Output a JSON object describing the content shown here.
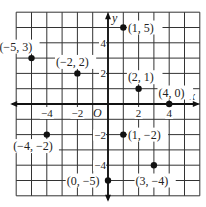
{
  "diagram": {
    "type": "coordinate-plane",
    "grid": {
      "xmin": -6,
      "xmax": 6,
      "ymin": -6,
      "ymax": 6
    },
    "axes": {
      "x_label": "x",
      "y_label": "y",
      "origin_label": "O"
    },
    "x_ticks": [
      {
        "value": -4,
        "label": "−4"
      },
      {
        "value": -2,
        "label": "−2"
      },
      {
        "value": 2,
        "label": "2"
      },
      {
        "value": 4,
        "label": "4"
      }
    ],
    "y_ticks": [
      {
        "value": 4,
        "label": "4"
      },
      {
        "value": 2,
        "label": "2"
      },
      {
        "value": -2,
        "label": "−2"
      },
      {
        "value": -4,
        "label": "−4"
      }
    ],
    "points": [
      {
        "x": -5,
        "y": 3,
        "label": "(−5, 3)",
        "lx": -7.1,
        "ly": 3.75,
        "lead": [
          -5.0,
          3.75,
          -2.3,
          3.75
        ]
      },
      {
        "x": -2,
        "y": 2,
        "label": "(−2, 2)",
        "lx": -3.4,
        "ly": 2.75,
        "lead": [
          -3.9,
          2.75,
          -5.9,
          2.75
        ]
      },
      {
        "x": 1,
        "y": 5,
        "label": "(1, 5)",
        "lx": 1.3,
        "ly": 5.0,
        "lead": [
          4.0,
          5.0,
          5.0,
          5.0
        ]
      },
      {
        "x": 2,
        "y": 1,
        "label": "(2, 1)",
        "lx": 1.3,
        "ly": 1.75,
        "lead": [
          4.1,
          1.75,
          5.0,
          1.75
        ]
      },
      {
        "x": 4,
        "y": 0,
        "label": "(4, 0)",
        "lx": 3.3,
        "ly": 0.75,
        "lead": [
          6.0,
          0.75,
          6.0,
          0.75
        ]
      },
      {
        "x": -4,
        "y": -2,
        "label": "(−4, −2)",
        "lx": -6.2,
        "ly": -2.75,
        "lead": [
          -2.9,
          -2.75,
          -0.1,
          -2.75
        ]
      },
      {
        "x": 1,
        "y": -2,
        "label": "(1, −2)",
        "lx": 1.3,
        "ly": -2.0,
        "lead": [
          4.4,
          -2.0,
          5.0,
          -2.0
        ]
      },
      {
        "x": 0,
        "y": -5,
        "label": "(0, −5)",
        "lx": -2.7,
        "ly": -5.0,
        "lead": [
          0.2,
          -5.0,
          0.2,
          -5.0
        ]
      },
      {
        "x": 3,
        "y": -4,
        "label": "(3, −4)",
        "lx": 1.8,
        "ly": -5.0,
        "lead": [
          4.6,
          -5.0,
          6.0,
          -5.0
        ]
      }
    ]
  }
}
